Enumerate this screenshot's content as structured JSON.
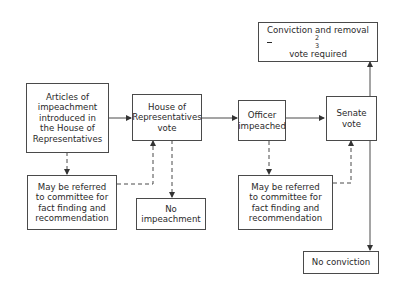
{
  "diagram": {
    "title": "",
    "nodes": {
      "articles": {
        "lines": [
          "Articles of",
          "impeachment",
          "introduced in",
          "the House of",
          "Representatives"
        ]
      },
      "committee_house": {
        "lines": [
          "May be referred",
          "to committee for",
          "fact finding and",
          "recommendation"
        ]
      },
      "house_vote": {
        "lines": [
          "House of",
          "Representatives",
          "vote"
        ]
      },
      "no_impeachment": {
        "lines": [
          "No",
          "impeachment"
        ]
      },
      "officer_impeached": {
        "lines": [
          "Officer",
          "impeached"
        ]
      },
      "committee_senate": {
        "lines": [
          "May be referred",
          "to committee for",
          "fact finding and",
          "recommendation"
        ]
      },
      "senate_vote": {
        "lines": [
          "Senate",
          "vote"
        ]
      },
      "conviction": {
        "line1": "Conviction and removal",
        "frac_num": "2",
        "frac_den": "3",
        "line2_rest": "vote required"
      },
      "no_conviction": {
        "lines": [
          "No conviction"
        ]
      }
    },
    "edges": [
      {
        "from": "articles",
        "to": "house_vote",
        "style": "solid"
      },
      {
        "from": "articles",
        "to": "committee_house",
        "style": "dashed"
      },
      {
        "from": "committee_house",
        "to": "house_vote",
        "style": "dashed"
      },
      {
        "from": "house_vote",
        "to": "no_impeachment",
        "style": "dashed"
      },
      {
        "from": "house_vote",
        "to": "officer_impeached",
        "style": "solid"
      },
      {
        "from": "officer_impeached",
        "to": "committee_senate",
        "style": "dashed"
      },
      {
        "from": "committee_senate",
        "to": "senate_vote",
        "style": "dashed"
      },
      {
        "from": "officer_impeached",
        "to": "senate_vote",
        "style": "solid"
      },
      {
        "from": "senate_vote",
        "to": "conviction",
        "style": "solid"
      },
      {
        "from": "senate_vote",
        "to": "no_conviction",
        "style": "solid"
      }
    ],
    "colors": {
      "line": "#4a4a4a",
      "text": "#2a2a2a",
      "background": "#ffffff"
    }
  }
}
